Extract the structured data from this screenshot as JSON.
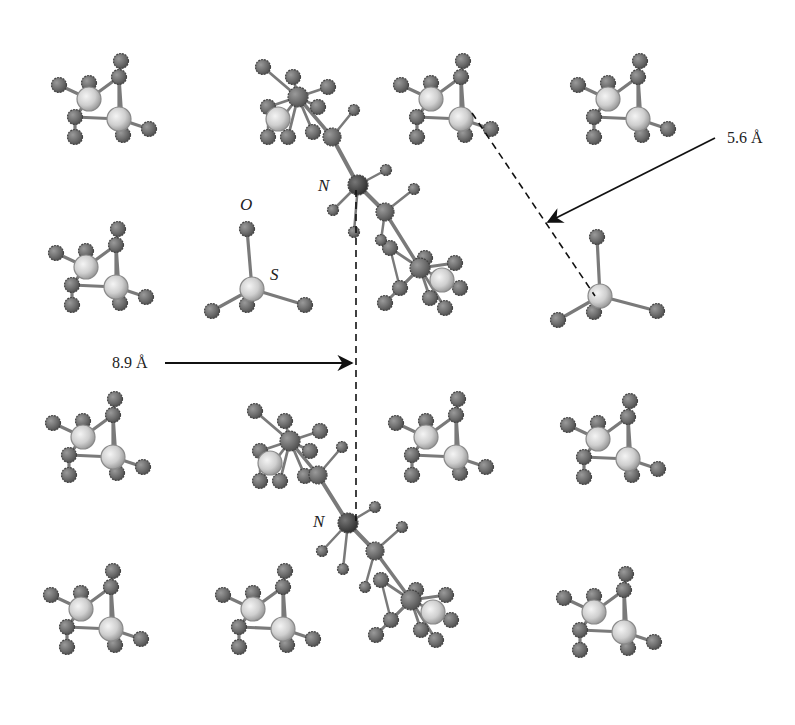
{
  "diagram": {
    "type": "crystal-structure-ball-and-stick",
    "colors": {
      "background": "#ffffff",
      "small_atom": "#6e6e6e",
      "small_atom_edge": "#4a4a4a",
      "large_atom": "#d8d8d8",
      "large_atom_edge": "#8a8a8a",
      "nitrogen_atom": "#4a4a4a",
      "bond": "#7a7a7a",
      "line": "#111111"
    },
    "labels": {
      "n_top": "N",
      "n_bottom": "N",
      "oxygen": "O",
      "sulfur": "S",
      "distance_vertical": "8.9 Å",
      "distance_diagonal": "5.6 Å"
    },
    "label_positions": {
      "n_top": [
        318,
        191
      ],
      "n_bottom": [
        313,
        527
      ],
      "oxygen": [
        240,
        210
      ],
      "sulfur": [
        270,
        280
      ],
      "distance_vertical": [
        112,
        368
      ],
      "distance_diagonal": [
        727,
        143
      ]
    },
    "measurements": [
      {
        "name": "interlayer-distance",
        "value": "8.9 Å",
        "from": [
          356,
          190
        ],
        "to": [
          356,
          525
        ],
        "arrow_from": [
          165,
          363
        ],
        "arrow_to": [
          352,
          363
        ]
      },
      {
        "name": "sulfate-distance",
        "value": "5.6 Å",
        "from": [
          472,
          113
        ],
        "to": [
          595,
          296
        ],
        "arrow_from": [
          715,
          138
        ],
        "arrow_to": [
          548,
          222
        ]
      }
    ],
    "clusters": [
      {
        "name": "cluster-r1c1",
        "cx": 103,
        "cy": 107
      },
      {
        "name": "cluster-r1c3",
        "cx": 445,
        "cy": 107
      },
      {
        "name": "cluster-r1c4",
        "cx": 622,
        "cy": 107
      },
      {
        "name": "cluster-r2c1",
        "cx": 100,
        "cy": 275
      },
      {
        "name": "cluster-r3c1",
        "cx": 97,
        "cy": 445
      },
      {
        "name": "cluster-r3c3",
        "cx": 440,
        "cy": 445
      },
      {
        "name": "cluster-r3c4",
        "cx": 612,
        "cy": 447
      },
      {
        "name": "cluster-r4c1",
        "cx": 95,
        "cy": 617
      },
      {
        "name": "cluster-r4c2",
        "cx": 267,
        "cy": 617
      },
      {
        "name": "cluster-r4c4",
        "cx": 608,
        "cy": 620
      }
    ],
    "sulfates": [
      {
        "name": "sulfate-labeled",
        "s": [
          252,
          289
        ],
        "o": [
          [
            247,
            229
          ],
          [
            212,
            311
          ],
          [
            305,
            305
          ],
          [
            247,
            305
          ]
        ]
      },
      {
        "name": "sulfate-right",
        "s": [
          600,
          296
        ],
        "o": [
          [
            597,
            237
          ],
          [
            558,
            320
          ],
          [
            657,
            311
          ],
          [
            594,
            312
          ]
        ]
      }
    ],
    "complex_units": [
      {
        "name": "complex-top",
        "n": [
          358,
          185
        ],
        "c1": [
          332,
          137
        ],
        "c2": [
          385,
          212
        ],
        "hn": [
          [
            386,
            170
          ],
          [
            333,
            210
          ],
          [
            354,
            232
          ]
        ],
        "hc": [
          [
            354,
            110
          ],
          [
            414,
            189
          ],
          [
            381,
            240
          ]
        ],
        "metal": [
          [
            298,
            97
          ],
          [
            420,
            268
          ]
        ]
      },
      {
        "name": "complex-bottom",
        "n": [
          348,
          523
        ],
        "c1": [
          318,
          475
        ],
        "c2": [
          375,
          551
        ],
        "hn": [
          [
            375,
            507
          ],
          [
            322,
            551
          ],
          [
            343,
            569
          ]
        ],
        "hc": [
          [
            342,
            447
          ],
          [
            402,
            527
          ],
          [
            365,
            587
          ]
        ],
        "metal": [
          [
            290,
            441
          ],
          [
            411,
            600
          ]
        ]
      }
    ]
  }
}
